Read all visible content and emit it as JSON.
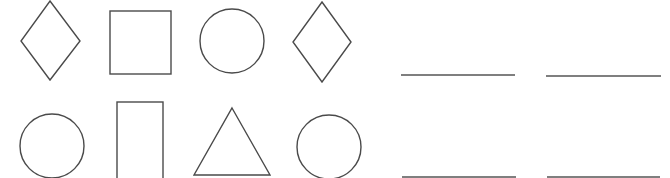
{
  "worksheet": {
    "stroke_color": "#4a4a4a",
    "line_color": "#555555",
    "rows": [
      {
        "shapes": [
          {
            "type": "diamond",
            "points": "50,1 80,41 50,80 21,41"
          },
          {
            "type": "square",
            "x": 110,
            "y": 11,
            "width": 61,
            "height": 63
          },
          {
            "type": "circle",
            "cx": 232,
            "cy": 41,
            "r": 32
          },
          {
            "type": "diamond",
            "points": "322,2 351,42 322,82 293,42"
          }
        ],
        "answer_blanks": [
          {
            "x1": 401,
            "x2": 515,
            "y": 75
          },
          {
            "x1": 546,
            "x2": 661,
            "y": 76
          }
        ]
      },
      {
        "shapes": [
          {
            "type": "circle",
            "cx": 52,
            "cy": 146,
            "r": 32
          },
          {
            "type": "rectangle",
            "x": 117,
            "y": 102,
            "width": 46,
            "height": 90
          },
          {
            "type": "triangle",
            "points": "232,108 270,175 194,175"
          },
          {
            "type": "circle",
            "cx": 329,
            "cy": 147,
            "r": 32
          }
        ],
        "answer_blanks": [
          {
            "x1": 402,
            "x2": 516,
            "y": 177
          },
          {
            "x1": 547,
            "x2": 660,
            "y": 177
          }
        ]
      }
    ]
  }
}
